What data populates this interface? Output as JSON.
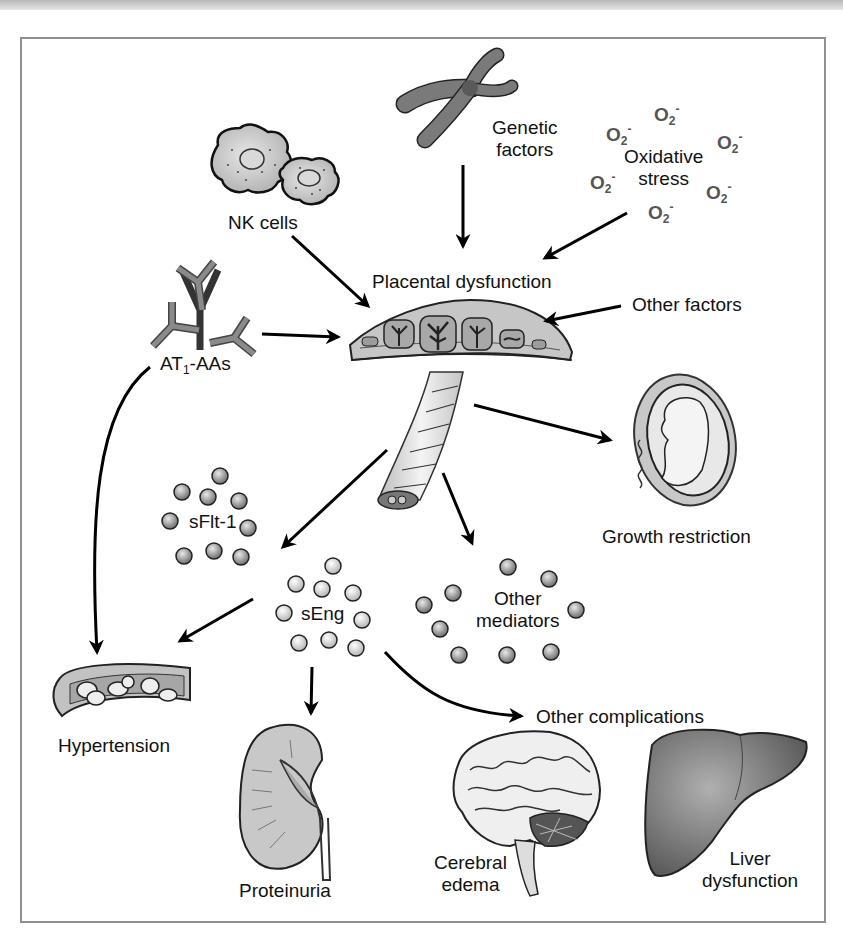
{
  "diagram": {
    "frame_color": "#8f8f8f",
    "accent_colors": {
      "cell_fill": "#c8c8c8",
      "antibody": "#8a8a8a",
      "superoxide_text": "#555555",
      "arrow": "#000000",
      "liver": "#6d6d6d"
    },
    "center": {
      "label": "Placental dysfunction"
    },
    "inputs": [
      {
        "id": "genetic",
        "label_line1": "Genetic",
        "label_line2": "factors",
        "icon": "chromosome-icon"
      },
      {
        "id": "nk",
        "label": "NK cells",
        "icon": "nk-cells-icon"
      },
      {
        "id": "oxidative",
        "label_line1": "Oxidative",
        "label_line2": "stress",
        "icon": "superoxide-icon"
      },
      {
        "id": "at1",
        "label_prefix": "AT",
        "label_sub": "1",
        "label_suffix": "-AAs",
        "icon": "antibody-icon"
      },
      {
        "id": "other_factors",
        "label": "Other factors"
      }
    ],
    "superoxide": {
      "base": "O",
      "sub": "2",
      "sup": "-",
      "count": 7
    },
    "mediators": [
      {
        "id": "sflt1",
        "label": "sFlt-1"
      },
      {
        "id": "seng",
        "label": "sEng"
      },
      {
        "id": "other_mediators",
        "label_line1": "Other",
        "label_line2": "mediators"
      }
    ],
    "outcomes": [
      {
        "id": "growth",
        "label": "Growth restriction",
        "icon": "fetus-icon"
      },
      {
        "id": "hypertension",
        "label": "Hypertension",
        "icon": "blood-vessel-icon"
      },
      {
        "id": "proteinuria",
        "label": "Proteinuria",
        "icon": "kidney-icon"
      },
      {
        "id": "other_complications",
        "label": "Other complications"
      },
      {
        "id": "cerebral",
        "label_line1": "Cerebral",
        "label_line2": "edema",
        "icon": "brain-icon"
      },
      {
        "id": "liver",
        "label_line1": "Liver",
        "label_line2": "dysfunction",
        "icon": "liver-icon"
      }
    ]
  }
}
